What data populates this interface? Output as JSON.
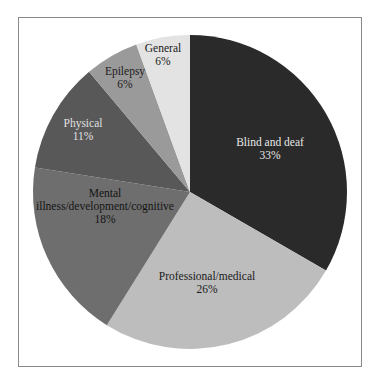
{
  "chart_data": {
    "type": "pie",
    "title": "",
    "center": [
      190,
      192
    ],
    "radius": 157,
    "start_angle_deg": -90,
    "direction": "clockwise",
    "slices": [
      {
        "label": "Blind and deaf",
        "value": 33,
        "display": "33%",
        "color": "#2a2a2a",
        "text_color": "#e8e8e8",
        "label_lines": [
          "Blind and deaf"
        ],
        "label_pos": [
          270,
          146
        ]
      },
      {
        "label": "Professional/medical",
        "value": 26,
        "display": "26%",
        "color": "#bdbdbd",
        "text_color": "#1a1a1a",
        "label_lines": [
          "Professional/medical"
        ],
        "label_pos": [
          207,
          280
        ]
      },
      {
        "label": "Mental illness/development/cognitive",
        "value": 18,
        "display": "18%",
        "color": "#6e6e6e",
        "text_color": "#141414",
        "label_lines": [
          "Mental",
          "illness/development/cognitive"
        ],
        "label_pos": [
          105,
          197
        ]
      },
      {
        "label": "Physical",
        "value": 11,
        "display": "11%",
        "color": "#585858",
        "text_color": "#e0e0e0",
        "label_lines": [
          "Physical"
        ],
        "label_pos": [
          83,
          127
        ]
      },
      {
        "label": "Epilepsy",
        "value": 6,
        "display": "6%",
        "color": "#9a9a9a",
        "text_color": "#1a1a1a",
        "label_lines": [
          "Epilepsy"
        ],
        "label_pos": [
          125,
          75
        ]
      },
      {
        "label": "General",
        "value": 6,
        "display": "6%",
        "color": "#e3e3e3",
        "text_color": "#1a1a1a",
        "label_lines": [
          "General"
        ],
        "label_pos": [
          163,
          52
        ]
      }
    ],
    "slice_boundaries_deg": [
      -90,
      30,
      122,
      189,
      230,
      250,
      270
    ],
    "legend": "none (labels inside slices)",
    "grid": false
  }
}
